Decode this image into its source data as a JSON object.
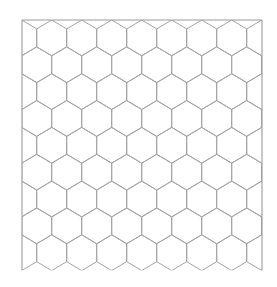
{
  "canvas": {
    "width": 277,
    "height": 287,
    "background": "#ffffff"
  },
  "pattern": {
    "type": "hexagonal-grid",
    "orientation": "pointy-top",
    "stroke_color": "#a3a3a3",
    "clip": {
      "x0": 22,
      "y0": 20,
      "x1": 262,
      "y1": 270.5
    },
    "hex_width": 30,
    "peak_half_height": 17.9,
    "side_half_height": 8.95,
    "first_row_center_y": 37.9,
    "even_row_first_center_x": 51.7,
    "odd_row_first_center_x": 36.7,
    "rows": 9,
    "full_columns_even_rows": 7,
    "full_columns_odd_rows": 7
  },
  "frame": {
    "stroke_color": "#9a9a9a",
    "sides": [
      "top",
      "left",
      "right"
    ]
  }
}
